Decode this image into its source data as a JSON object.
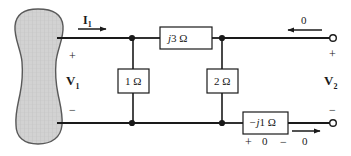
{
  "figure": {
    "type": "two-port-network-circuit",
    "background_color": "#ffffff",
    "line_color": "#1a1a1a",
    "blob_fill": "#cfcfcf",
    "blob_stroke": "#555555"
  },
  "source_block": {
    "name": "shaded-source-blob",
    "description": "hatched gray hourglass-shaped block at left"
  },
  "input_port": {
    "current_label": "I",
    "current_subscript": "1",
    "voltage_label": "V",
    "voltage_subscript": "1",
    "plus": "+",
    "minus": "−"
  },
  "output_port": {
    "voltage_label": "V",
    "voltage_subscript": "2",
    "plus": "+",
    "minus": "−",
    "top_current_value": "0",
    "bottom_current_value": "0"
  },
  "components": [
    {
      "id": "series-inductor",
      "label": "j3 Ω",
      "italic_part": "j",
      "rest_part": "3 Ω",
      "orientation": "horizontal",
      "position": "top-branch-middle"
    },
    {
      "id": "shunt-resistor-1",
      "label": "1 Ω",
      "italic_part": "",
      "rest_part": "1 Ω",
      "orientation": "vertical",
      "position": "left-shunt"
    },
    {
      "id": "shunt-resistor-2",
      "label": "2 Ω",
      "italic_part": "",
      "rest_part": "2 Ω",
      "orientation": "vertical",
      "position": "right-shunt"
    },
    {
      "id": "series-capacitor",
      "label": "−j1 Ω",
      "italic_part": "−j",
      "rest_part": "1 Ω",
      "orientation": "horizontal",
      "position": "bottom-branch-right"
    }
  ],
  "capacitor_annotations": {
    "plus": "+",
    "value": "0",
    "minus": "−"
  }
}
